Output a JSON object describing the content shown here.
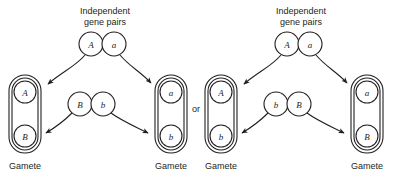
{
  "figure": {
    "connector_label": "or",
    "background_color": "#ffffff",
    "line_color": "#231f20"
  },
  "panels": [
    {
      "id": "panel-left",
      "heading_line1": "Independent",
      "heading_line2": "gene pairs",
      "top_pair": {
        "left_allele": "A",
        "right_allele": "a"
      },
      "middle_pair": {
        "left_allele": "B",
        "right_allele": "b"
      },
      "gametes": [
        {
          "id": "gamete-left",
          "label": "Gamete",
          "alleles": [
            "A",
            "B"
          ]
        },
        {
          "id": "gamete-right",
          "label": "Gamete",
          "alleles": [
            "a",
            "b"
          ]
        }
      ]
    },
    {
      "id": "panel-right",
      "heading_line1": "Independent",
      "heading_line2": "gene pairs",
      "top_pair": {
        "left_allele": "A",
        "right_allele": "a"
      },
      "middle_pair": {
        "left_allele": "b",
        "right_allele": "B"
      },
      "gametes": [
        {
          "id": "gamete-left",
          "label": "Gamete",
          "alleles": [
            "A",
            "b"
          ]
        },
        {
          "id": "gamete-right",
          "label": "Gamete",
          "alleles": [
            "a",
            "B"
          ]
        }
      ]
    }
  ]
}
